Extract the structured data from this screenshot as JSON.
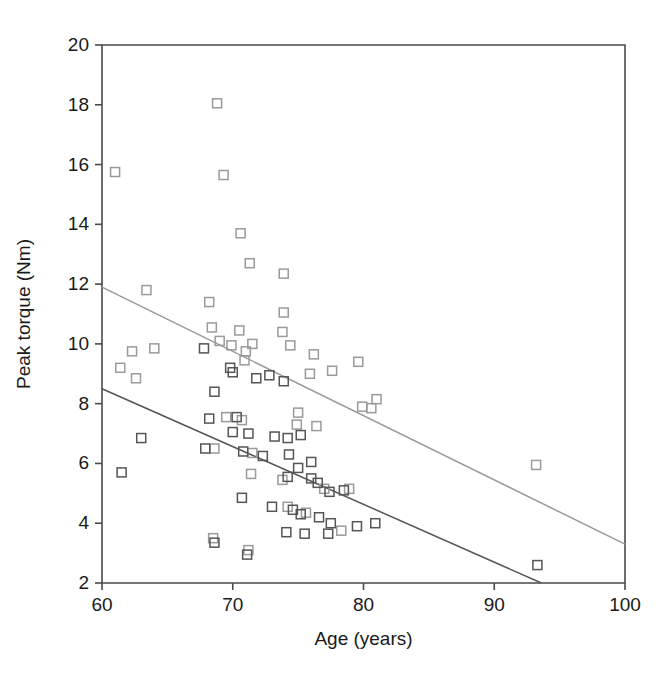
{
  "chart_data": {
    "type": "scatter",
    "title": "",
    "xlabel": "Age (years)",
    "ylabel": "Peak torque (Nm)",
    "xlim": [
      60,
      100
    ],
    "ylim": [
      2,
      20
    ],
    "xticks": [
      60,
      70,
      80,
      90,
      100
    ],
    "yticks": [
      2,
      4,
      6,
      8,
      10,
      12,
      14,
      16,
      18,
      20
    ],
    "grid": false,
    "legend": "none",
    "colors": {
      "series_light": "#9a9a9a",
      "series_dark": "#555555",
      "axis": "#4a4a4a",
      "background": "#ffffff"
    },
    "series": [
      {
        "name": "light-series",
        "marker": "open-square",
        "color": "#9a9a9a",
        "points": [
          [
            61.0,
            15.75
          ],
          [
            63.4,
            11.8
          ],
          [
            64.0,
            9.85
          ],
          [
            61.4,
            9.2
          ],
          [
            62.3,
            9.75
          ],
          [
            62.6,
            8.85
          ],
          [
            68.8,
            18.05
          ],
          [
            69.3,
            15.65
          ],
          [
            70.6,
            13.7
          ],
          [
            71.3,
            12.7
          ],
          [
            73.9,
            12.35
          ],
          [
            68.2,
            11.4
          ],
          [
            68.4,
            10.55
          ],
          [
            69.0,
            10.1
          ],
          [
            70.5,
            10.45
          ],
          [
            71.0,
            9.75
          ],
          [
            71.5,
            10.0
          ],
          [
            70.9,
            9.45
          ],
          [
            73.9,
            11.05
          ],
          [
            73.8,
            10.4
          ],
          [
            74.4,
            9.95
          ],
          [
            69.9,
            9.95
          ],
          [
            76.2,
            9.65
          ],
          [
            77.6,
            9.1
          ],
          [
            79.6,
            9.4
          ],
          [
            75.9,
            9.0
          ],
          [
            81.0,
            8.15
          ],
          [
            79.9,
            7.9
          ],
          [
            80.6,
            7.85
          ],
          [
            75.0,
            7.7
          ],
          [
            69.5,
            7.55
          ],
          [
            70.7,
            7.45
          ],
          [
            74.9,
            7.3
          ],
          [
            76.4,
            7.25
          ],
          [
            93.2,
            5.95
          ],
          [
            68.6,
            6.5
          ],
          [
            71.5,
            6.35
          ],
          [
            71.4,
            5.65
          ],
          [
            73.8,
            5.45
          ],
          [
            77.0,
            5.15
          ],
          [
            78.9,
            5.15
          ],
          [
            68.5,
            3.5
          ],
          [
            71.2,
            3.1
          ],
          [
            74.2,
            4.55
          ],
          [
            75.6,
            4.35
          ],
          [
            78.3,
            3.75
          ]
        ]
      },
      {
        "name": "dark-series",
        "marker": "open-square",
        "color": "#555555",
        "points": [
          [
            61.5,
            5.7
          ],
          [
            63.0,
            6.85
          ],
          [
            67.8,
            9.85
          ],
          [
            68.6,
            8.4
          ],
          [
            69.8,
            9.2
          ],
          [
            70.0,
            9.05
          ],
          [
            71.8,
            8.85
          ],
          [
            72.8,
            8.95
          ],
          [
            73.9,
            8.75
          ],
          [
            68.2,
            7.5
          ],
          [
            70.3,
            7.55
          ],
          [
            70.0,
            7.05
          ],
          [
            71.2,
            7.0
          ],
          [
            73.2,
            6.9
          ],
          [
            74.2,
            6.85
          ],
          [
            75.2,
            6.95
          ],
          [
            67.9,
            6.5
          ],
          [
            70.8,
            6.4
          ],
          [
            72.3,
            6.25
          ],
          [
            74.3,
            6.3
          ],
          [
            76.0,
            6.05
          ],
          [
            75.0,
            5.85
          ],
          [
            76.0,
            5.5
          ],
          [
            74.2,
            5.55
          ],
          [
            76.5,
            5.35
          ],
          [
            77.4,
            5.05
          ],
          [
            78.5,
            5.1
          ],
          [
            70.7,
            4.85
          ],
          [
            73.0,
            4.55
          ],
          [
            74.6,
            4.45
          ],
          [
            75.2,
            4.3
          ],
          [
            76.6,
            4.2
          ],
          [
            77.5,
            4.0
          ],
          [
            80.9,
            4.0
          ],
          [
            79.5,
            3.9
          ],
          [
            68.6,
            3.35
          ],
          [
            71.1,
            2.95
          ],
          [
            74.1,
            3.7
          ],
          [
            75.5,
            3.65
          ],
          [
            77.3,
            3.65
          ],
          [
            93.3,
            2.6
          ]
        ]
      }
    ],
    "trendlines": [
      {
        "name": "light-trendline",
        "color": "#9a9a9a",
        "x0": 60,
        "y0": 11.9,
        "x1": 100,
        "y1": 3.3
      },
      {
        "name": "dark-trendline",
        "color": "#555555",
        "x0": 60,
        "y0": 8.5,
        "x1": 93.6,
        "y1": 2.0
      }
    ]
  }
}
